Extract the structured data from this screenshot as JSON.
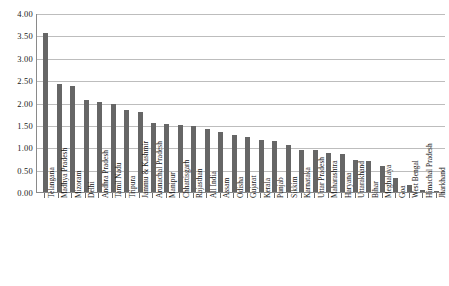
{
  "chart_data": {
    "type": "bar",
    "title": "",
    "subtitle": "",
    "xlabel": "",
    "ylabel": "",
    "ylim": [
      0,
      4.0
    ],
    "ytick_labels": [
      "4.00",
      "3.50",
      "3.00",
      "2.50",
      "2.00",
      "1.50",
      "1.00",
      "0.50",
      "0.00"
    ],
    "ytick_values": [
      4.0,
      3.5,
      3.0,
      2.5,
      2.0,
      1.5,
      1.0,
      0.5,
      0.0
    ],
    "grid": true,
    "legend": null,
    "legend_position": "none",
    "bar_color": "#666666",
    "grid_color": "#bdbdbd",
    "axis_color": "#8a8a8a",
    "categories": [
      "Telangana",
      "Madhya Pradesh",
      "Mizoram",
      "Delhi",
      "Andhra Pradesh",
      "Tamil Nadu",
      "Tripura",
      "Jammu & Kashmir",
      "Arunachal Pradesh",
      "Manipur",
      "Chhattisgarh",
      "Rajasthan",
      "All India",
      "Assam",
      "Odisha",
      "Gujarat",
      "Kerala",
      "Punjab",
      "Sikkim",
      "Karnataka",
      "Uttar Pradesh",
      "Maharashtra",
      "Haryana",
      "Uttarakhand",
      "Bihar",
      "Meghalaya",
      "Goa",
      "West Bengal",
      "Himachal Pradesh",
      "Jharkhand"
    ],
    "values": [
      3.55,
      2.42,
      2.36,
      2.05,
      2.01,
      1.97,
      1.83,
      1.78,
      1.55,
      1.52,
      1.49,
      1.48,
      1.4,
      1.34,
      1.27,
      1.23,
      1.17,
      1.13,
      1.06,
      0.94,
      0.93,
      0.87,
      0.86,
      0.72,
      0.7,
      0.59,
      0.32,
      0.15,
      0.04,
      0.01
    ]
  }
}
